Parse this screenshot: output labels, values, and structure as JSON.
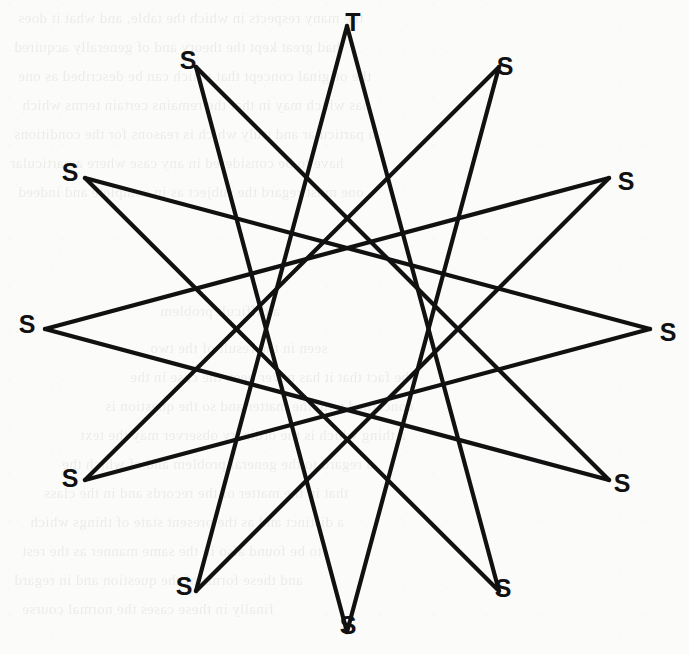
{
  "figure": {
    "name": "star-polygon-diagram",
    "background_color": "#fbfbfa",
    "line_color": "#111111",
    "label_color": "#111111",
    "center": {
      "x": 347,
      "y": 329
    },
    "radius": 303,
    "step": 5,
    "vertex_count": 12,
    "vertices": [
      {
        "id": "v0",
        "label": "T",
        "angle_deg": -90,
        "x": 347,
        "y": 26,
        "label_x": 353,
        "label_y": 22
      },
      {
        "id": "v1",
        "label": "S",
        "angle_deg": -60,
        "x": 499,
        "y": 67,
        "label_x": 505,
        "label_y": 66
      },
      {
        "id": "v2",
        "label": "S",
        "angle_deg": -30,
        "x": 609,
        "y": 178,
        "label_x": 626,
        "label_y": 181
      },
      {
        "id": "v3",
        "label": "S",
        "angle_deg": 0,
        "x": 650,
        "y": 329,
        "label_x": 668,
        "label_y": 332
      },
      {
        "id": "v4",
        "label": "S",
        "angle_deg": 30,
        "x": 609,
        "y": 480,
        "label_x": 622,
        "label_y": 483
      },
      {
        "id": "v5",
        "label": "S",
        "angle_deg": 60,
        "x": 499,
        "y": 591,
        "label_x": 503,
        "label_y": 588
      },
      {
        "id": "v6",
        "label": "S",
        "angle_deg": 90,
        "x": 347,
        "y": 632,
        "label_x": 348,
        "label_y": 625
      },
      {
        "id": "v7",
        "label": "S",
        "angle_deg": 120,
        "x": 196,
        "y": 591,
        "label_x": 184,
        "label_y": 586
      },
      {
        "id": "v8",
        "label": "S",
        "angle_deg": 150,
        "x": 85,
        "y": 480,
        "label_x": 70,
        "label_y": 478
      },
      {
        "id": "v9",
        "label": "S",
        "angle_deg": 180,
        "x": 45,
        "y": 329,
        "label_x": 27,
        "label_y": 324
      },
      {
        "id": "v10",
        "label": "S",
        "angle_deg": 210,
        "x": 85,
        "y": 178,
        "label_x": 70,
        "label_y": 172
      },
      {
        "id": "v11",
        "label": "S",
        "angle_deg": 240,
        "x": 196,
        "y": 67,
        "label_x": 188,
        "label_y": 60
      }
    ],
    "edges": [
      [
        0,
        5
      ],
      [
        5,
        10
      ],
      [
        10,
        3
      ],
      [
        3,
        8
      ],
      [
        8,
        1
      ],
      [
        1,
        6
      ],
      [
        6,
        11
      ],
      [
        11,
        4
      ],
      [
        4,
        9
      ],
      [
        9,
        2
      ],
      [
        2,
        7
      ],
      [
        7,
        0
      ]
    ]
  },
  "bleed_text": {
    "note": "faint mirrored show-through text from the reverse side of the scanned page",
    "lines": [
      {
        "x": 18,
        "y": 4,
        "text": "the many respects in which the table, and what it does"
      },
      {
        "x": 14,
        "y": 33,
        "text": "had great kept the theory and of generally acquired"
      },
      {
        "x": 18,
        "y": 62,
        "text": "the original concept that which can be described as one"
      },
      {
        "x": 22,
        "y": 91,
        "text": "has which may in that the remains certain terms which"
      },
      {
        "x": 14,
        "y": 120,
        "text": "a particular and truly which is reasons for the conditions"
      },
      {
        "x": 10,
        "y": 149,
        "text": "have to be considered in any case where a particular"
      },
      {
        "x": 18,
        "y": 178,
        "text": "one must regard the subject as in complete and indeed"
      },
      {
        "x": 160,
        "y": 297,
        "text": "a difficult problem"
      },
      {
        "x": 150,
        "y": 334,
        "text": "seen in the result of the two"
      },
      {
        "x": 130,
        "y": 363,
        "text": "the fact that it has never been the case in the"
      },
      {
        "x": 105,
        "y": 392,
        "text": "concerned with the matter and so the question is"
      },
      {
        "x": 80,
        "y": 421,
        "text": "a thing which is the ordinary observer may the text"
      },
      {
        "x": 62,
        "y": 450,
        "text": "a regard to the general problem and of which the"
      },
      {
        "x": 44,
        "y": 479,
        "text": "that in the matter of the records and in the class"
      },
      {
        "x": 30,
        "y": 508,
        "text": "a distinct and as the present state of things which"
      },
      {
        "x": 22,
        "y": 537,
        "text": "to be found also in the same manner as the rest"
      },
      {
        "x": 14,
        "y": 566,
        "text": "and these forms of the question and in regard"
      },
      {
        "x": 22,
        "y": 595,
        "text": "finally in these cases the normal course"
      }
    ]
  }
}
